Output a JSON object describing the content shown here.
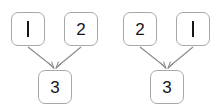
{
  "page": {
    "background_color": "#ffffff",
    "width": 224,
    "height": 112
  },
  "style": {
    "node_border_color": "#a8a8a8",
    "node_fill_color": "#ffffff",
    "label_color": "#151515",
    "edge_color": "#8a8a8a"
  },
  "diagrams": [
    {
      "name": "left-diagram",
      "nodes": [
        {
          "id": "n1",
          "label": "1",
          "position": "top-left",
          "glyph": "vertical-stroke"
        },
        {
          "id": "n2",
          "label": "2",
          "position": "top-right",
          "glyph": "digit"
        },
        {
          "id": "n3",
          "label": "3",
          "position": "bottom",
          "glyph": "digit"
        }
      ],
      "edges": [
        {
          "from": "1",
          "to": "3",
          "arrow": "open-v"
        },
        {
          "from": "2",
          "to": "3",
          "arrow": "open-v"
        }
      ]
    },
    {
      "name": "right-diagram",
      "nodes": [
        {
          "id": "n2",
          "label": "2",
          "position": "top-left",
          "glyph": "digit"
        },
        {
          "id": "n1",
          "label": "1",
          "position": "top-right",
          "glyph": "vertical-stroke"
        },
        {
          "id": "n3",
          "label": "3",
          "position": "bottom",
          "glyph": "digit"
        }
      ],
      "edges": [
        {
          "from": "2",
          "to": "3",
          "arrow": "open-v"
        },
        {
          "from": "1",
          "to": "3",
          "arrow": "open-v"
        }
      ]
    }
  ]
}
